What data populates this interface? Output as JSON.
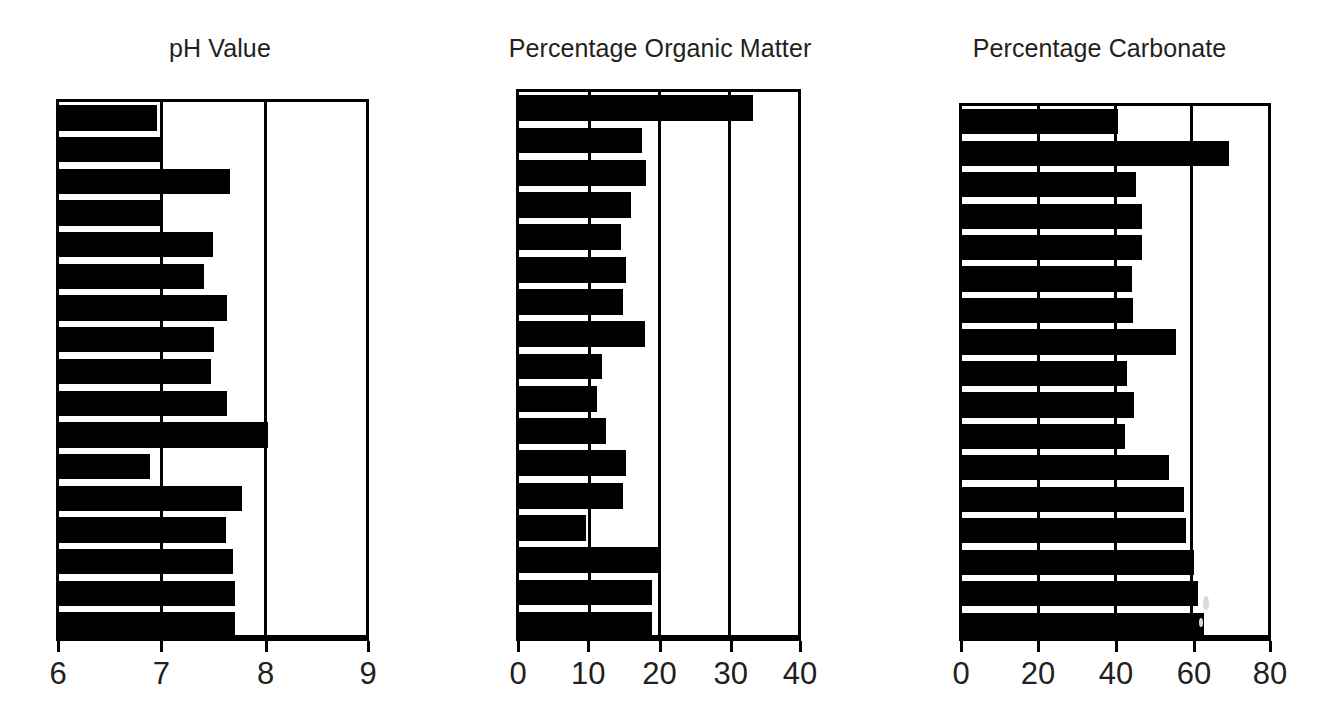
{
  "figure": {
    "background_color": "#ffffff",
    "bar_color": "#000000",
    "axis_color": "#000000",
    "text_color": "#231f20"
  },
  "panels": [
    {
      "id": "ph",
      "title": "pH Value",
      "tick_labels": [
        "6",
        "7",
        "8",
        "9"
      ]
    },
    {
      "id": "organic",
      "title": "Percentage Organic Matter",
      "tick_labels": [
        "0",
        "10",
        "20",
        "30",
        "40"
      ]
    },
    {
      "id": "carbonate",
      "title": "Percentage Carbonate",
      "tick_labels": [
        "0",
        "20",
        "40",
        "60",
        "80"
      ]
    }
  ],
  "chart_data": [
    {
      "type": "bar",
      "orientation": "horizontal",
      "title": "pH Value",
      "xlabel": "",
      "ylabel": "",
      "xlim": [
        6,
        9
      ],
      "xticks": [
        6,
        7,
        8,
        9
      ],
      "grid": true,
      "legend": "none",
      "categories": [
        "1",
        "2",
        "3",
        "4",
        "5",
        "6",
        "7",
        "8",
        "9",
        "10",
        "11",
        "12",
        "13",
        "14",
        "15",
        "16",
        "17"
      ],
      "values": [
        6.94,
        6.99,
        7.64,
        6.99,
        7.48,
        7.39,
        7.61,
        7.49,
        7.46,
        7.61,
        8.0,
        6.87,
        7.75,
        7.6,
        7.67,
        7.69,
        7.69
      ]
    },
    {
      "type": "bar",
      "orientation": "horizontal",
      "title": "Percentage Organic Matter",
      "xlabel": "",
      "ylabel": "",
      "xlim": [
        0,
        40
      ],
      "xticks": [
        0,
        10,
        20,
        30,
        40
      ],
      "grid": true,
      "legend": "none",
      "categories": [
        "1",
        "2",
        "3",
        "4",
        "5",
        "6",
        "7",
        "8",
        "9",
        "10",
        "11",
        "12",
        "13",
        "14",
        "15",
        "16",
        "17"
      ],
      "values": [
        32.8,
        17.3,
        17.8,
        15.7,
        14.3,
        15.0,
        14.6,
        17.7,
        11.6,
        11.0,
        12.2,
        15.0,
        14.6,
        9.4,
        19.6,
        18.6,
        18.6
      ]
    },
    {
      "type": "bar",
      "orientation": "horizontal",
      "title": "Percentage Carbonate",
      "xlabel": "",
      "ylabel": "",
      "xlim": [
        0,
        80
      ],
      "xticks": [
        0,
        20,
        40,
        60,
        80
      ],
      "grid": true,
      "legend": "none",
      "categories": [
        "1",
        "2",
        "3",
        "4",
        "5",
        "6",
        "7",
        "8",
        "9",
        "10",
        "11",
        "12",
        "13",
        "14",
        "15",
        "16",
        "17"
      ],
      "values": [
        40.0,
        68.4,
        44.7,
        46.2,
        46.2,
        43.6,
        43.9,
        54.8,
        42.3,
        44.1,
        41.8,
        53.0,
        56.9,
        57.4,
        59.5,
        60.5,
        62.1
      ]
    }
  ]
}
